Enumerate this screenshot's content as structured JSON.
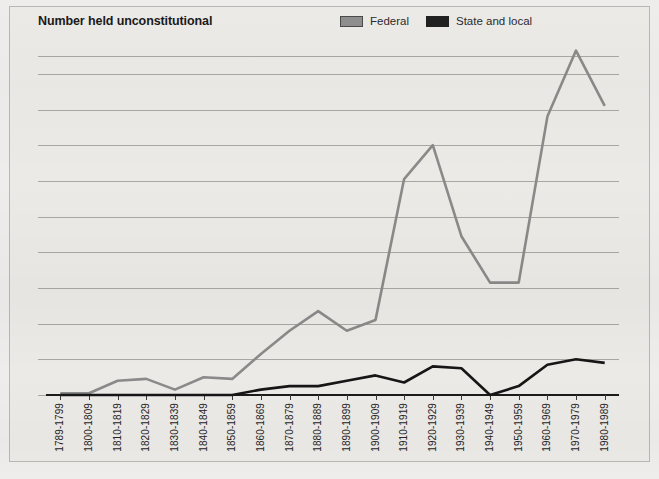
{
  "figure": {
    "title": "Number held unconstitutional"
  },
  "legend": {
    "position": "top-right",
    "items": [
      {
        "label": "Federal",
        "color": "#8a8a8a",
        "icon": "square-swatch"
      },
      {
        "label": "State and local",
        "color": "#161616",
        "icon": "square-swatch"
      }
    ]
  },
  "chart_data": {
    "type": "line",
    "title": "Number held unconstitutional",
    "xlabel": "",
    "ylabel": "",
    "ylim": [
      0,
      195
    ],
    "yticks": [
      0,
      20,
      40,
      60,
      80,
      100,
      120,
      140,
      160,
      180,
      190
    ],
    "ytick_labels": [
      "0",
      "20",
      "40",
      "60",
      "80",
      "100",
      "120",
      "140",
      "160",
      "180",
      "190"
    ],
    "grid": true,
    "categories": [
      "1789-1799",
      "1800-1809",
      "1810-1819",
      "1820-1829",
      "1830-1839",
      "1840-1849",
      "1850-1859",
      "1860-1869",
      "1870-1879",
      "1880-1889",
      "1890-1899",
      "1900-1909",
      "1910-1919",
      "1920-1929",
      "1930-1939",
      "1940-1949",
      "1950-1959",
      "1960-1969",
      "1970-1979",
      "1980-1989"
    ],
    "series": [
      {
        "name": "Federal",
        "color": "#8a8a8a",
        "values": [
          1,
          1,
          8,
          9,
          3,
          10,
          9,
          23,
          36,
          47,
          36,
          42,
          121,
          140,
          89,
          63,
          63,
          156,
          193,
          162
        ]
      },
      {
        "name": "State and local",
        "color": "#161616",
        "values": [
          0,
          0,
          0,
          0,
          0,
          0,
          0,
          3,
          5,
          5,
          8,
          11,
          7,
          16,
          15,
          0,
          5,
          17,
          20,
          18
        ]
      }
    ]
  }
}
